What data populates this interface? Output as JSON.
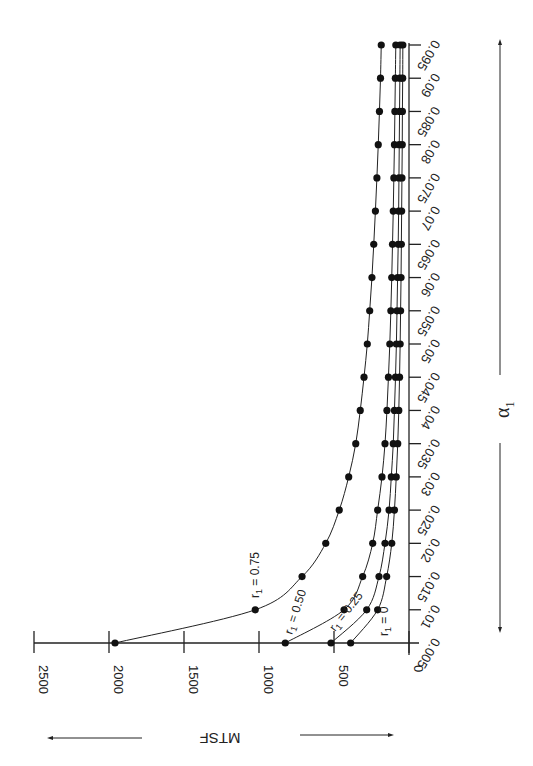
{
  "chart_data": {
    "type": "line",
    "title": "",
    "xlabel": "α1",
    "ylabel": "MTSF",
    "orientation": "rotated 90° (α1 axis runs vertically, MTSF axis runs horizontally; figure printed sideways)",
    "x": [
      0.005,
      0.01,
      0.015,
      0.02,
      0.025,
      0.03,
      0.035,
      0.04,
      0.045,
      0.05,
      0.055,
      0.06,
      0.065,
      0.07,
      0.075,
      0.08,
      0.085,
      0.09,
      0.095
    ],
    "x_tick_labels": [
      "0.005",
      "0.01",
      "0.015",
      "0.02",
      "0.025",
      "0.03",
      "0.035",
      "0.04",
      "0.045",
      "0.05",
      "0.055",
      "0.06",
      "0.065",
      "0.07",
      "0.075",
      "0.08",
      "0.085",
      "0.09",
      "0.095"
    ],
    "y_ticks": [
      0,
      500,
      1000,
      1500,
      2000,
      2500
    ],
    "y_tick_labels": [
      "0",
      "500",
      "1000",
      "1500",
      "2000",
      "2500"
    ],
    "ylim": [
      0,
      2500
    ],
    "xlim": [
      0.005,
      0.095
    ],
    "grid": false,
    "legend": "inline curve labels",
    "series": [
      {
        "name": "r1 = 0.75",
        "label_main": "r",
        "label_sub": "1",
        "label_rest": " = 0.75",
        "values": [
          1960,
          1025,
          713,
          555,
          465,
          402,
          355,
          325,
          300,
          278,
          262,
          247,
          235,
          224,
          214,
          205,
          197,
          190,
          185
        ]
      },
      {
        "name": "r1 = 0.50",
        "label_main": "r",
        "label_sub": "1",
        "label_rest": " = 0.50",
        "values": [
          825,
          433,
          309,
          242,
          209,
          180,
          160,
          147,
          137,
          128,
          121,
          115,
          110,
          105,
          101,
          97,
          94,
          91,
          88
        ]
      },
      {
        "name": "r1 = 0.25",
        "label_main": "r",
        "label_sub": "1",
        "label_rest": " = 0.25",
        "values": [
          520,
          282,
          200,
          160,
          133,
          118,
          105,
          97,
          90,
          84,
          80,
          76,
          72,
          69,
          67,
          65,
          63,
          61,
          59
        ]
      },
      {
        "name": "r1 = 0",
        "label_main": "r",
        "label_sub": "1",
        "label_rest": " = 0",
        "values": [
          389,
          209,
          149,
          115,
          97,
          85,
          75,
          68,
          63,
          59,
          56,
          53,
          51,
          49,
          47,
          45,
          44,
          42,
          41
        ]
      }
    ]
  },
  "labels": {
    "y_axis_title": "MTSF",
    "x_axis_title_main": "α",
    "x_axis_title_sub": "1"
  },
  "colors": {
    "ink": "#222222",
    "background": "#ffffff"
  }
}
